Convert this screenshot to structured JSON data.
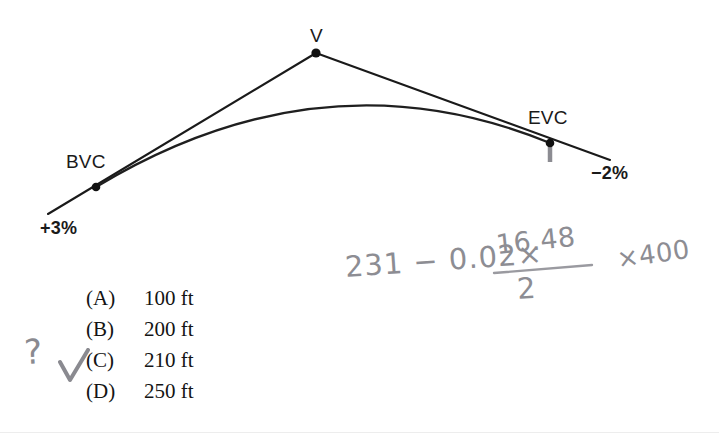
{
  "diagram": {
    "labels": {
      "bvc": "BVC",
      "vertex": "V",
      "evc": "EVC",
      "grade_in": "+3%",
      "grade_out": "−2%"
    },
    "colors": {
      "ink": "#1a1a1a",
      "curve": "#1f1f1f",
      "tick": "#8c8c92",
      "background": "#ffffff"
    },
    "geometry": {
      "bvc_point": [
        96,
        187
      ],
      "vertex_point": [
        316,
        53
      ],
      "evc_point": [
        550,
        143
      ],
      "grade_in_start": [
        48,
        214
      ],
      "grade_out_end": [
        610,
        160
      ],
      "curve_apex": [
        352,
        106
      ]
    }
  },
  "question": {
    "choices": [
      {
        "tag": "(A)",
        "text": "100 ft"
      },
      {
        "tag": "(B)",
        "text": "200 ft"
      },
      {
        "tag": "(C)",
        "text": "210 ft"
      },
      {
        "tag": "(D)",
        "text": "250 ft"
      }
    ]
  },
  "handwriting": {
    "expression_lhs": "231 − 0.02×",
    "fraction_numerator": "16.48",
    "fraction_denominator": "2",
    "expression_tail": "×400",
    "question_mark": "?",
    "check_mark": "✓",
    "color": "#8d8d93"
  }
}
